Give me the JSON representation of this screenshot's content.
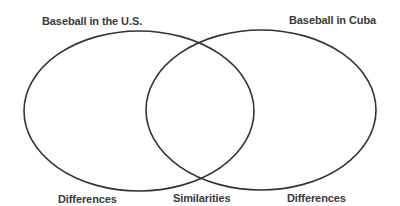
{
  "diagram": {
    "type": "venn",
    "left_circle": {
      "title": "Baseball in the U.S.",
      "bottom_label": "Differences"
    },
    "right_circle": {
      "title": "Baseball in Cuba",
      "bottom_label": "Differences"
    },
    "overlap": {
      "bottom_label": "Similarities"
    },
    "stroke_color": "#333333"
  }
}
